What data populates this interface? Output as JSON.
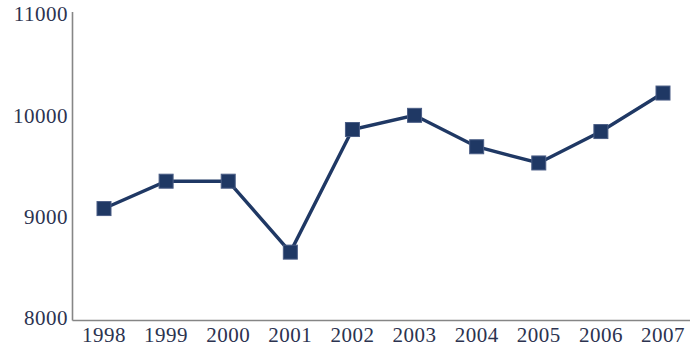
{
  "chart_data": {
    "type": "line",
    "title": "",
    "subtitle": "",
    "xlabel": "",
    "ylabel": "",
    "categories": [
      "1998",
      "1999",
      "2000",
      "2001",
      "2002",
      "2003",
      "2004",
      "2005",
      "2006",
      "2007"
    ],
    "values": [
      9080,
      9350,
      9350,
      8650,
      9860,
      10000,
      9690,
      9530,
      9840,
      10220
    ],
    "series": [
      {
        "name": "",
        "values": [
          9080,
          9350,
          9350,
          8650,
          9860,
          10000,
          9690,
          9530,
          9840,
          10220
        ]
      }
    ],
    "ylim": [
      8000,
      11000
    ],
    "ytick_labels": [
      "8000",
      "9000",
      "10000",
      "11000"
    ],
    "ytick_values": [
      8000,
      9000,
      10000,
      11000
    ],
    "xtick_labels": [
      "1998",
      "1999",
      "2000",
      "2001",
      "2002",
      "2003",
      "2004",
      "2005",
      "2006",
      "2007"
    ],
    "grid": false,
    "legend": false,
    "legend_position": "none",
    "marker": "square",
    "series_color": "#1f3864",
    "axis_color": "#868686",
    "label_color": "#2c3350",
    "background_color": "#ffffff"
  },
  "axis": {
    "y_labels": [
      "11000",
      "10000",
      "9000",
      "8000"
    ],
    "x_labels": [
      "1998",
      "1999",
      "2000",
      "2001",
      "2002",
      "2003",
      "2004",
      "2005",
      "2006",
      "2007"
    ]
  }
}
